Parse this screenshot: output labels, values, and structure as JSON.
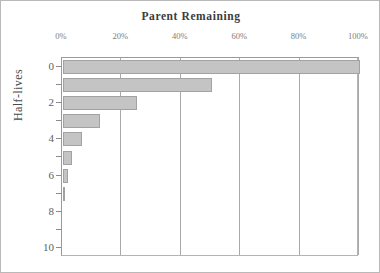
{
  "chart_data": {
    "type": "bar",
    "orientation": "horizontal",
    "title": "Parent Remaining",
    "xlabel": "",
    "ylabel": "Half-lives",
    "categories": [
      "0",
      "1",
      "2",
      "3",
      "4",
      "5",
      "6",
      "7",
      "8",
      "9",
      "10"
    ],
    "values": [
      100,
      50,
      25,
      12.5,
      6.25,
      3.125,
      1.5625,
      0.78125,
      0,
      0,
      0
    ],
    "xlim": [
      0,
      100
    ],
    "ylim": [
      0,
      10
    ],
    "xticks": [
      0,
      20,
      40,
      60,
      80,
      100
    ],
    "xtick_labels": [
      "0%",
      "20%",
      "40%",
      "60%",
      "80%",
      "100%"
    ],
    "yticks": [
      0,
      1,
      2,
      3,
      4,
      5,
      6,
      7,
      8,
      9,
      10
    ],
    "ytick_labels": [
      "0",
      "",
      "2",
      "",
      "4",
      "",
      "6",
      "",
      "8",
      "",
      "10"
    ],
    "grid": "vertical",
    "legend": "none",
    "bar_color": "#c4c4c4",
    "bar_edge_color": "#a2a2a2",
    "axis_color": "#9a9a9a",
    "gridline_color": "#a9a9a9",
    "title_color": "#3b3b3b",
    "tick_label_color": "#7d7d7d",
    "background_color": "#ffffff",
    "frame_color": "#b9b9b9"
  }
}
